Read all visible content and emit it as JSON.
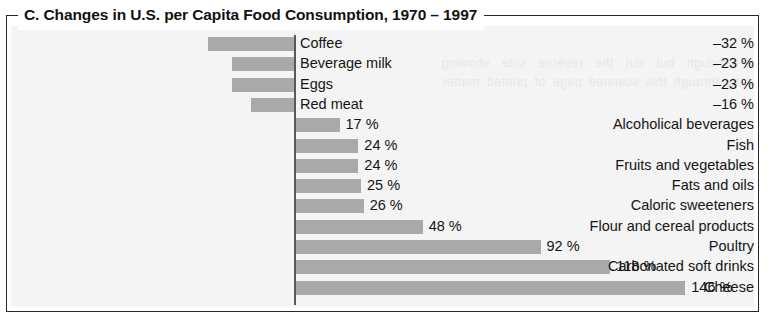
{
  "figure": {
    "title": "C. Changes in U.S. per Capita Food Consumption, 1970 – 1997"
  },
  "chart_data": {
    "type": "bar",
    "orientation": "horizontal",
    "title": "C. Changes in U.S. per Capita Food Consumption, 1970 – 1997",
    "xlabel": "",
    "ylabel": "",
    "unit": "%",
    "grid": false,
    "legend": false,
    "axis_zero_line": true,
    "value_label_format": "{v}%",
    "xlim": [
      -40,
      160
    ],
    "categories": [
      "Coffee",
      "Beverage milk",
      "Eggs",
      "Red meat",
      "Alcoholical beverages",
      "Fish",
      "Fruits and vegetables",
      "Fats and oils",
      "Caloric sweeteners",
      "Flour and cereal products",
      "Poultry",
      "Carbonated soft drinks",
      "Cheese"
    ],
    "values": [
      -32,
      -23,
      -23,
      -16,
      17,
      24,
      24,
      25,
      26,
      48,
      92,
      118,
      146
    ],
    "value_labels": [
      "–32 %",
      "–23 %",
      "–23 %",
      "–16 %",
      "17 %",
      "24 %",
      "24 %",
      "25 %",
      "26 %",
      "48 %",
      "92 %",
      "118 %",
      "146 %"
    ],
    "colors": {
      "bar": "#a9a9a9",
      "axis": "#57595b",
      "panel_background": "#f4f4f4",
      "frame": "#26282a",
      "text": "#141414"
    }
  },
  "ghost_text": "the enough but out the reverse side showing faintly through this scanned page of printed matter"
}
